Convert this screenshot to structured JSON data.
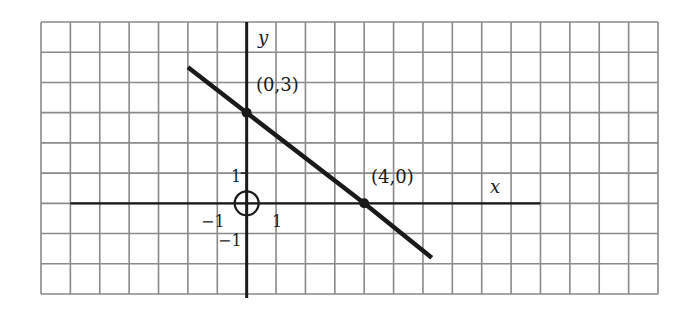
{
  "chart_data": {
    "type": "line",
    "title": "",
    "xlabel": "x",
    "ylabel": "y",
    "grid": true,
    "xlim": [
      -7,
      14
    ],
    "ylim": [
      -3,
      6
    ],
    "tick_labels": {
      "x": [
        {
          "value": -1,
          "label": "−1"
        },
        {
          "value": 1,
          "label": "1"
        }
      ],
      "y": [
        {
          "value": 1,
          "label": "1"
        },
        {
          "value": -1,
          "label": "−1"
        }
      ]
    },
    "series": [
      {
        "name": "line",
        "x": [
          -2,
          0,
          4,
          6.3
        ],
        "y": [
          4.5,
          3,
          0,
          -1.8
        ],
        "equation": "3x + 4y = 12"
      }
    ],
    "points": [
      {
        "x": 0,
        "y": 3,
        "label": "(0,3)"
      },
      {
        "x": 4,
        "y": 0,
        "label": "(4,0)"
      }
    ],
    "annotations": [
      {
        "type": "circle",
        "x": 0,
        "y": 0,
        "note": "origin marked with circle"
      }
    ]
  },
  "labels": {
    "x_axis": "x",
    "y_axis": "y",
    "point_a": "(0,3)",
    "point_b": "(4,0)",
    "tick_x_neg1": "−1",
    "tick_x_1": "1",
    "tick_y_1": "1",
    "tick_y_neg1": "−1"
  },
  "colors": {
    "grid": "#8a8a8a",
    "axis": "#1a1a1a",
    "line": "#1a1a1a",
    "background": "#ffffff"
  }
}
